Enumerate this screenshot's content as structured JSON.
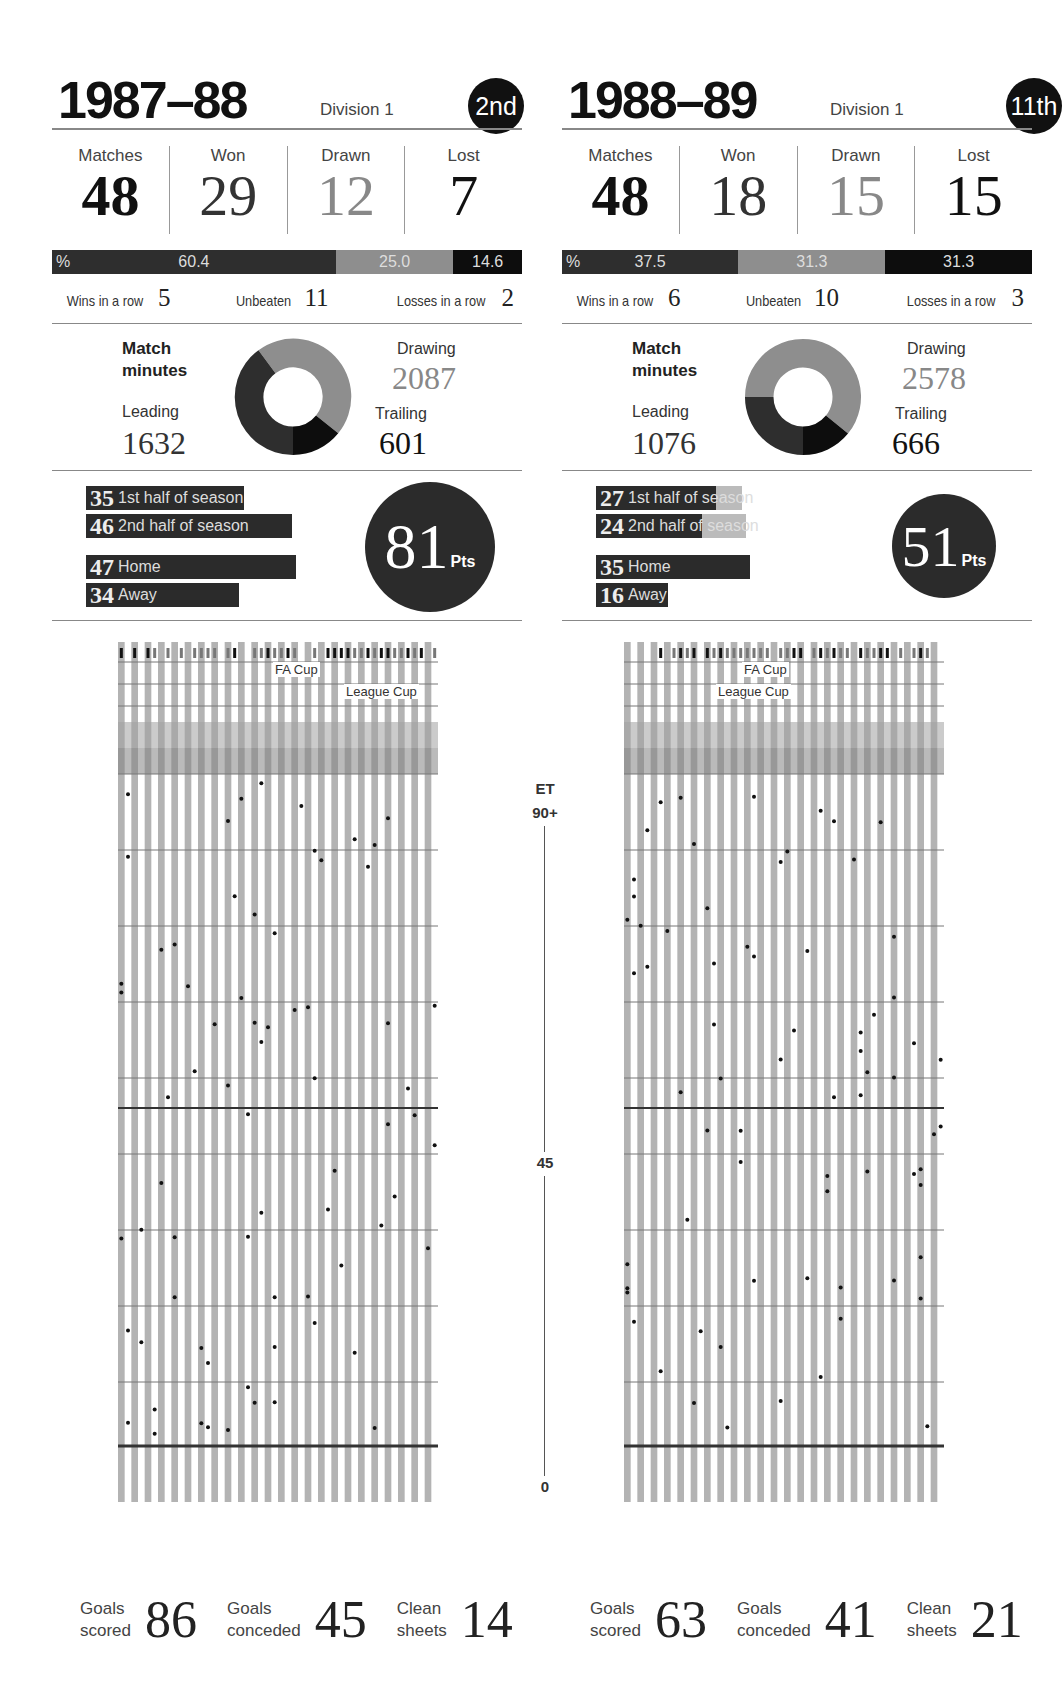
{
  "seasons": [
    {
      "title": "1987–88",
      "division": "Division 1",
      "position": "2nd",
      "stats": [
        {
          "label": "Matches",
          "value": "48"
        },
        {
          "label": "Won",
          "value": "29"
        },
        {
          "label": "Drawn",
          "value": "12"
        },
        {
          "label": "Lost",
          "value": "7"
        }
      ],
      "percent_prefix": "%",
      "percent": {
        "won": "60.4",
        "drawn": "25.0",
        "lost": "14.6"
      },
      "streaks": [
        {
          "label": "Wins in a row",
          "value": "5"
        },
        {
          "label": "Unbeaten",
          "value": "11"
        },
        {
          "label": "Losses in a row",
          "value": "2"
        }
      ],
      "match_minutes": {
        "title_line1": "Match",
        "title_line2": "minutes",
        "leading_label": "Leading",
        "leading": "1632",
        "drawing_label": "Drawing",
        "drawing": "2087",
        "trailing_label": "Trailing",
        "trailing": "601"
      },
      "points_bars": [
        {
          "value": "35",
          "label": "1st half of season"
        },
        {
          "value": "46",
          "label": "2nd half of season"
        },
        {
          "value": "47",
          "label": "Home"
        },
        {
          "value": "34",
          "label": "Away"
        }
      ],
      "points_total": "81",
      "points_unit": "Pts",
      "cup_labels": {
        "fa": "FA Cup",
        "league": "League Cup"
      },
      "totals": [
        {
          "label1": "Goals",
          "label2": "scored",
          "value": "86"
        },
        {
          "label1": "Goals",
          "label2": "conceded",
          "value": "45"
        },
        {
          "label1": "Clean",
          "label2": "sheets",
          "value": "14"
        }
      ]
    },
    {
      "title": "1988–89",
      "division": "Division 1",
      "position": "11th",
      "stats": [
        {
          "label": "Matches",
          "value": "48"
        },
        {
          "label": "Won",
          "value": "18"
        },
        {
          "label": "Drawn",
          "value": "15"
        },
        {
          "label": "Lost",
          "value": "15"
        }
      ],
      "percent_prefix": "%",
      "percent": {
        "won": "37.5",
        "drawn": "31.3",
        "lost": "31.3"
      },
      "streaks": [
        {
          "label": "Wins in a row",
          "value": "6"
        },
        {
          "label": "Unbeaten",
          "value": "10"
        },
        {
          "label": "Losses in a row",
          "value": "3"
        }
      ],
      "match_minutes": {
        "title_line1": "Match",
        "title_line2": "minutes",
        "leading_label": "Leading",
        "leading": "1076",
        "drawing_label": "Drawing",
        "drawing": "2578",
        "trailing_label": "Trailing",
        "trailing": "666"
      },
      "points_bars": [
        {
          "value": "27",
          "label": "1st half of season"
        },
        {
          "value": "24",
          "label": "2nd half of season"
        },
        {
          "value": "35",
          "label": "Home"
        },
        {
          "value": "16",
          "label": "Away"
        }
      ],
      "points_total": "51",
      "points_unit": "Pts",
      "cup_labels": {
        "fa": "FA Cup",
        "league": "League Cup"
      },
      "totals": [
        {
          "label1": "Goals",
          "label2": "scored",
          "value": "63"
        },
        {
          "label1": "Goals",
          "label2": "conceded",
          "value": "41"
        },
        {
          "label1": "Clean",
          "label2": "sheets",
          "value": "21"
        }
      ]
    }
  ],
  "axis": {
    "et": "ET",
    "ninety_plus": "90+",
    "mid": "45",
    "zero": "0"
  },
  "colors": {
    "won": "#2b2b2b",
    "drawn": "#8e8e8e",
    "lost": "#0d0d0d",
    "stripe": "#b3b3b3",
    "et_band": "#a5a5a5"
  },
  "chart_data": [
    {
      "type": "pie",
      "title": "1987–88 Match minutes",
      "categories": [
        "Leading",
        "Drawing",
        "Trailing"
      ],
      "values": [
        1632,
        2087,
        601
      ]
    },
    {
      "type": "pie",
      "title": "1988–89 Match minutes",
      "categories": [
        "Leading",
        "Drawing",
        "Trailing"
      ],
      "values": [
        1076,
        2578,
        666
      ]
    },
    {
      "type": "bar",
      "title": "Result percentages",
      "categories": [
        "Won",
        "Drawn",
        "Lost"
      ],
      "series": [
        {
          "name": "1987–88",
          "values": [
            60.4,
            25.0,
            14.6
          ]
        },
        {
          "name": "1988–89",
          "values": [
            37.5,
            31.3,
            31.3
          ]
        }
      ]
    },
    {
      "type": "bar",
      "title": "Points breakdown",
      "categories": [
        "1st half of season",
        "2nd half of season",
        "Home",
        "Away"
      ],
      "series": [
        {
          "name": "1987–88",
          "values": [
            35,
            46,
            47,
            34
          ]
        },
        {
          "name": "1988–89",
          "values": [
            27,
            24,
            35,
            16
          ]
        }
      ]
    },
    {
      "type": "scatter",
      "title": "Goal minutes per match (0–90+, ET)",
      "ylabel": "Minute",
      "yticks": [
        "0",
        "45",
        "90+",
        "ET"
      ],
      "series": [
        {
          "name": "1987–88 goals scored",
          "value": 86
        },
        {
          "name": "1987–88 goals conceded",
          "value": 45
        },
        {
          "name": "1988–89 goals scored",
          "value": 63
        },
        {
          "name": "1988–89 goals conceded",
          "value": 41
        }
      ]
    }
  ]
}
